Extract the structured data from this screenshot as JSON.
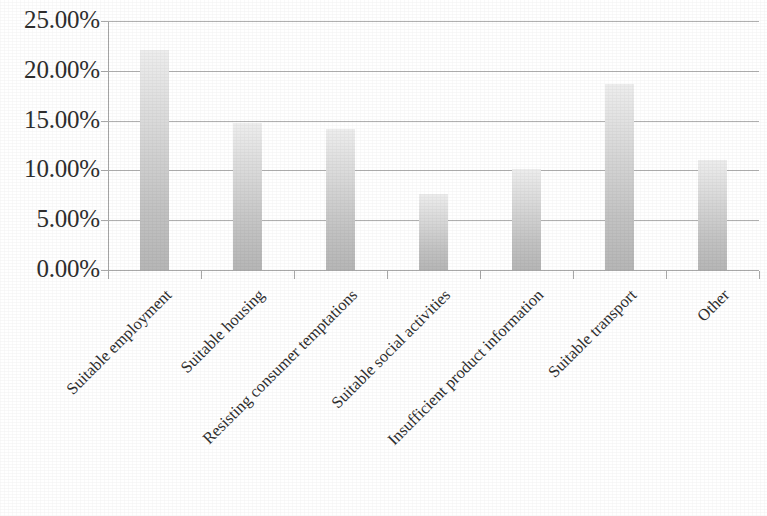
{
  "chart_data": {
    "type": "bar",
    "title": "",
    "subtitle": "",
    "xlabel": "",
    "ylabel": "",
    "ylim": [
      0,
      25
    ],
    "ytick_labels": [
      "25.00%",
      "20.00%",
      "15.00%",
      "10.00%",
      "5.00%",
      "0.00%"
    ],
    "ytick_values": [
      25,
      20,
      15,
      10,
      5,
      0
    ],
    "ytick_format": "percent",
    "grid": true,
    "grid_axis": "y",
    "legend": "none",
    "categories": [
      "Suitable employment",
      "Suitable housing",
      "Resisting consumer temptations",
      "Suitable social activities",
      "Insufficient product information",
      "Suitable transport",
      "Other"
    ],
    "values": [
      22.1,
      14.8,
      14.2,
      7.6,
      10.1,
      18.7,
      11.0
    ],
    "value_labels": [
      "22.10%",
      "14.80%",
      "14.20%",
      "7.60%",
      "10.10%",
      "18.70%",
      "11.00%"
    ],
    "bar_color_top": "#ededed",
    "bar_color_bottom": "#b6b6b6",
    "gridline_color": "#b0b0b0",
    "axis_color": "#a8a8a8",
    "text_color": "#2e2e2e",
    "background_color": "#ffffff",
    "xtick_label_rotation": -45
  },
  "axis": {
    "y_ticks": [
      {
        "label": "25.00%",
        "value": 25
      },
      {
        "label": "20.00%",
        "value": 20
      },
      {
        "label": "15.00%",
        "value": 15
      },
      {
        "label": "10.00%",
        "value": 10
      },
      {
        "label": "5.00%",
        "value": 5
      },
      {
        "label": "0.00%",
        "value": 0
      }
    ]
  },
  "bars": [
    {
      "label": "Suitable employment",
      "value": 22.1
    },
    {
      "label": "Suitable housing",
      "value": 14.8
    },
    {
      "label": "Resisting consumer temptations",
      "value": 14.2
    },
    {
      "label": "Suitable social activities",
      "value": 7.6
    },
    {
      "label": "Insufficient product information",
      "value": 10.1
    },
    {
      "label": "Suitable transport",
      "value": 18.7
    },
    {
      "label": "Other",
      "value": 11.0
    }
  ]
}
